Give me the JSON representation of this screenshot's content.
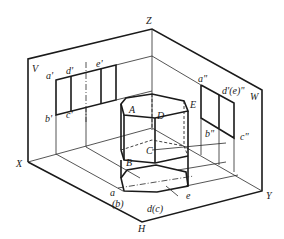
{
  "diagram": {
    "planes": {
      "V": "V",
      "W": "W",
      "H": "H"
    },
    "axes": {
      "X": "X",
      "Y": "Y",
      "Z": "Z"
    },
    "solid_vertices": {
      "A": "A",
      "B": "B",
      "C": "C",
      "D": "D",
      "E": "E"
    },
    "v_projection_labels": {
      "a": "a'",
      "d": "d'",
      "e": "e'",
      "b": "b'",
      "c": "c'"
    },
    "w_projection_labels": {
      "a": "a\"",
      "de": "d'(e)\"",
      "b": "b\"",
      "c": "c\""
    },
    "h_projection_labels": {
      "a": "a",
      "b": "(b)",
      "dc": "d(c)",
      "e": "e"
    },
    "colors": {
      "line": "#1a1a1a",
      "background": "#ffffff"
    }
  }
}
